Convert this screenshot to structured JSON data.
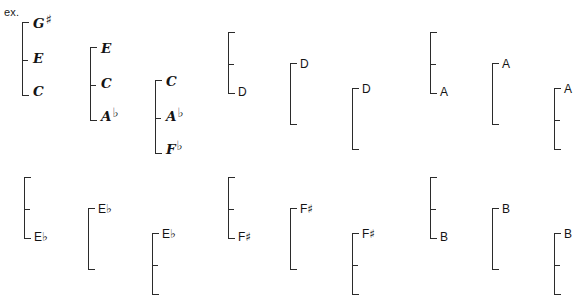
{
  "page": {
    "example_label": "ex.",
    "ink_color": "#2b2b2b",
    "text_color": "#141414",
    "background": "#ffffff",
    "width": 587,
    "height": 306
  },
  "groups": [
    {
      "id": "g1",
      "row": "top",
      "style": "hand",
      "x": 22,
      "y": 22,
      "height": 74,
      "tick_offset": 38,
      "notes": [
        {
          "label": "G",
          "accidental": "♯",
          "pos": "top",
          "x": 11,
          "y": -5
        },
        {
          "label": "E",
          "accidental": "",
          "pos": "middle",
          "x": 11,
          "y": 30
        },
        {
          "label": "C",
          "accidental": "",
          "pos": "bottom",
          "x": 11,
          "y": 63
        }
      ]
    },
    {
      "id": "g2",
      "row": "top",
      "style": "hand",
      "x": 90,
      "y": 47,
      "height": 74,
      "tick_offset": 38,
      "notes": [
        {
          "label": "E",
          "accidental": "",
          "pos": "top",
          "x": 11,
          "y": -5
        },
        {
          "label": "C",
          "accidental": "",
          "pos": "middle",
          "x": 11,
          "y": 30
        },
        {
          "label": "A",
          "accidental": "♭",
          "pos": "bottom",
          "x": 11,
          "y": 63
        }
      ]
    },
    {
      "id": "g3",
      "row": "top",
      "style": "hand",
      "x": 155,
      "y": 80,
      "height": 74,
      "tick_offset": 38,
      "notes": [
        {
          "label": "C",
          "accidental": "",
          "pos": "top",
          "x": 11,
          "y": -5
        },
        {
          "label": "A",
          "accidental": "♭",
          "pos": "middle",
          "x": 11,
          "y": 30
        },
        {
          "label": "F",
          "accidental": "♭",
          "pos": "bottom",
          "x": 11,
          "y": 63
        }
      ]
    },
    {
      "id": "g4",
      "row": "top",
      "style": "plain",
      "x": 228,
      "y": 32,
      "height": 62,
      "tick_offset": 32,
      "notes": [
        {
          "label": "D",
          "accidental": "",
          "pos": "bottom",
          "x": 10,
          "y": 54
        }
      ]
    },
    {
      "id": "g5",
      "row": "top",
      "style": "plain",
      "x": 290,
      "y": 63,
      "height": 62,
      "tick_offset": 0,
      "notes": [
        {
          "label": "D",
          "accidental": "",
          "pos": "top",
          "x": 10,
          "y": -5
        }
      ]
    },
    {
      "id": "g6",
      "row": "top",
      "style": "plain",
      "x": 352,
      "y": 88,
      "height": 62,
      "tick_offset": 0,
      "notes": [
        {
          "label": "D",
          "accidental": "",
          "pos": "top",
          "x": 10,
          "y": -5
        }
      ]
    },
    {
      "id": "g7",
      "row": "top",
      "style": "plain",
      "x": 430,
      "y": 32,
      "height": 62,
      "tick_offset": 32,
      "notes": [
        {
          "label": "A",
          "accidental": "",
          "pos": "bottom",
          "x": 10,
          "y": 54
        }
      ]
    },
    {
      "id": "g8",
      "row": "top",
      "style": "plain",
      "x": 492,
      "y": 63,
      "height": 62,
      "tick_offset": 0,
      "notes": [
        {
          "label": "A",
          "accidental": "",
          "pos": "top",
          "x": 10,
          "y": -5
        }
      ]
    },
    {
      "id": "g9",
      "row": "top",
      "style": "plain",
      "x": 554,
      "y": 88,
      "height": 62,
      "tick_offset": 32,
      "notes": [
        {
          "label": "A",
          "accidental": "",
          "pos": "top",
          "x": 10,
          "y": -5
        }
      ]
    },
    {
      "id": "g10",
      "row": "bottom",
      "style": "plain",
      "x": 24,
      "y": 177,
      "height": 62,
      "tick_offset": 32,
      "notes": [
        {
          "label": "E",
          "accidental": "♭",
          "pos": "bottom",
          "x": 10,
          "y": 54
        }
      ]
    },
    {
      "id": "g11",
      "row": "bottom",
      "style": "plain",
      "x": 88,
      "y": 208,
      "height": 62,
      "tick_offset": 0,
      "notes": [
        {
          "label": "E",
          "accidental": "♭",
          "pos": "top",
          "x": 10,
          "y": -5
        }
      ]
    },
    {
      "id": "g12",
      "row": "bottom",
      "style": "plain",
      "x": 152,
      "y": 233,
      "height": 62,
      "tick_offset": 32,
      "notes": [
        {
          "label": "E",
          "accidental": "♭",
          "pos": "top",
          "x": 10,
          "y": -5
        }
      ]
    },
    {
      "id": "g13",
      "row": "bottom",
      "style": "plain",
      "x": 228,
      "y": 177,
      "height": 62,
      "tick_offset": 32,
      "notes": [
        {
          "label": "F",
          "accidental": "♯",
          "pos": "bottom",
          "x": 10,
          "y": 54
        }
      ]
    },
    {
      "id": "g14",
      "row": "bottom",
      "style": "plain",
      "x": 290,
      "y": 208,
      "height": 62,
      "tick_offset": 0,
      "notes": [
        {
          "label": "F",
          "accidental": "♯",
          "pos": "top",
          "x": 10,
          "y": -5
        }
      ]
    },
    {
      "id": "g15",
      "row": "bottom",
      "style": "plain",
      "x": 352,
      "y": 233,
      "height": 62,
      "tick_offset": 32,
      "notes": [
        {
          "label": "F",
          "accidental": "♯",
          "pos": "top",
          "x": 10,
          "y": -5
        }
      ]
    },
    {
      "id": "g16",
      "row": "bottom",
      "style": "plain",
      "x": 430,
      "y": 177,
      "height": 62,
      "tick_offset": 32,
      "notes": [
        {
          "label": "B",
          "accidental": "",
          "pos": "bottom",
          "x": 10,
          "y": 54
        }
      ]
    },
    {
      "id": "g17",
      "row": "bottom",
      "style": "plain",
      "x": 492,
      "y": 208,
      "height": 62,
      "tick_offset": 0,
      "notes": [
        {
          "label": "B",
          "accidental": "",
          "pos": "top",
          "x": 10,
          "y": -5
        }
      ]
    },
    {
      "id": "g18",
      "row": "bottom",
      "style": "plain",
      "x": 554,
      "y": 233,
      "height": 62,
      "tick_offset": 32,
      "notes": [
        {
          "label": "B",
          "accidental": "",
          "pos": "top",
          "x": 10,
          "y": -5
        }
      ]
    }
  ]
}
